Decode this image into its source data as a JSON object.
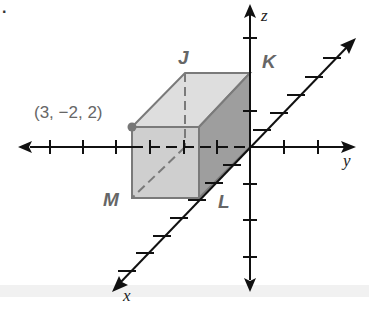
{
  "problem_number": ".",
  "diagram": {
    "type": "3d-coordinate-box",
    "axes": {
      "x_label": "x",
      "y_label": "y",
      "z_label": "z"
    },
    "vertices": {
      "J": "J",
      "K": "K",
      "L": "L",
      "M": "M"
    },
    "point_label": "(3, −2, 2)",
    "colors": {
      "front_face": "#cfcfcf",
      "top_face": "#dedede",
      "side_face": "#9e9e9e",
      "edge": "#7a7a7a",
      "axis": "#111111",
      "label": "#666666"
    }
  }
}
